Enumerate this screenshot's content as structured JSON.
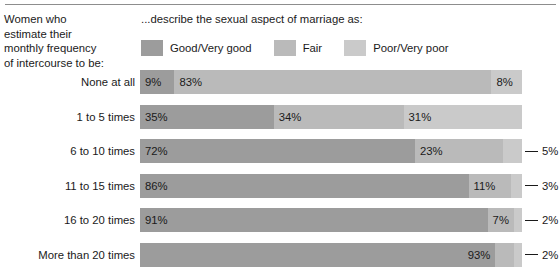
{
  "header": {
    "stub_lines": [
      "Women who",
      "estimate their",
      "monthly frequency",
      "of intercourse to be:"
    ],
    "main_title": "...describe the sexual aspect of marriage as:"
  },
  "legend": {
    "items": [
      {
        "label": "Good/Very good",
        "color": "#9c9c9c"
      },
      {
        "label": "Fair",
        "color": "#bababa"
      },
      {
        "label": "Poor/Very poor",
        "color": "#cacaca"
      }
    ]
  },
  "colors": {
    "good": "#9c9c9c",
    "fair": "#bababa",
    "poor": "#cacaca",
    "rule": "#8d8d8d",
    "text": "#1a1a1a"
  },
  "chart_data": {
    "type": "bar",
    "subtype": "horizontal-stacked-100",
    "title": "...describe the sexual aspect of marriage as:",
    "xlabel": "",
    "ylabel": "Women who estimate their monthly frequency of intercourse to be:",
    "xlim": [
      0,
      100
    ],
    "grid": false,
    "legend_position": "top",
    "categories": [
      "None at all",
      "1 to 5 times",
      "6 to 10 times",
      "11 to 15 times",
      "16 to 20 times",
      "More than 20 times"
    ],
    "series": [
      {
        "name": "Good/Very good",
        "values": [
          9,
          35,
          72,
          86,
          91,
          93
        ]
      },
      {
        "name": "Fair",
        "values": [
          83,
          34,
          23,
          11,
          7,
          5
        ]
      },
      {
        "name": "Poor/Very poor",
        "values": [
          8,
          31,
          5,
          3,
          2,
          2
        ]
      }
    ]
  },
  "rows": [
    {
      "label": "None at all",
      "segments": [
        {
          "key": "good",
          "value": 9,
          "text": "9%",
          "placement": "inside-left"
        },
        {
          "key": "fair",
          "value": 83,
          "text": "83%",
          "placement": "inside-left"
        },
        {
          "key": "poor",
          "value": 8,
          "text": "8%",
          "placement": "inside-left"
        }
      ]
    },
    {
      "label": "1 to 5 times",
      "segments": [
        {
          "key": "good",
          "value": 35,
          "text": "35%",
          "placement": "inside-left"
        },
        {
          "key": "fair",
          "value": 34,
          "text": "34%",
          "placement": "inside-left"
        },
        {
          "key": "poor",
          "value": 31,
          "text": "31%",
          "placement": "inside-left"
        }
      ]
    },
    {
      "label": "6 to 10 times",
      "segments": [
        {
          "key": "good",
          "value": 72,
          "text": "72%",
          "placement": "inside-left"
        },
        {
          "key": "fair",
          "value": 23,
          "text": "23%",
          "placement": "inside-left"
        },
        {
          "key": "poor",
          "value": 5,
          "text": "5%",
          "placement": "callout-right"
        }
      ]
    },
    {
      "label": "11 to 15 times",
      "segments": [
        {
          "key": "good",
          "value": 86,
          "text": "86%",
          "placement": "inside-left"
        },
        {
          "key": "fair",
          "value": 11,
          "text": "11%",
          "placement": "inside-left"
        },
        {
          "key": "poor",
          "value": 3,
          "text": "3%",
          "placement": "callout-right"
        }
      ]
    },
    {
      "label": "16 to 20 times",
      "segments": [
        {
          "key": "good",
          "value": 91,
          "text": "91%",
          "placement": "inside-left"
        },
        {
          "key": "fair",
          "value": 7,
          "text": "7%",
          "placement": "inside-left"
        },
        {
          "key": "poor",
          "value": 2,
          "text": "2%",
          "placement": "callout-right"
        }
      ]
    },
    {
      "label": "More than 20 times",
      "segments": [
        {
          "key": "good",
          "value": 93,
          "text": "93%",
          "placement": "inside-right"
        },
        {
          "key": "fair",
          "value": 5,
          "text": "5%",
          "placement": "inbar-leader-right"
        },
        {
          "key": "poor",
          "value": 2,
          "text": "2%",
          "placement": "callout-right"
        }
      ]
    }
  ]
}
